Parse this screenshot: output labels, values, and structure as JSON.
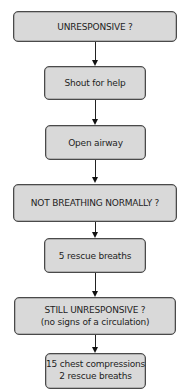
{
  "flowchart": {
    "title": "Basic life support algorithm",
    "nodes": [
      {
        "id": "unresponsive",
        "lines": [
          "UNRESPONSIVE ?"
        ]
      },
      {
        "id": "shout",
        "lines": [
          "Shout for help"
        ]
      },
      {
        "id": "airway",
        "lines": [
          "Open airway"
        ]
      },
      {
        "id": "not-breathing",
        "lines": [
          "NOT BREATHING NORMALLY ?"
        ]
      },
      {
        "id": "rescue-breaths",
        "lines": [
          "5 rescue breaths"
        ]
      },
      {
        "id": "still-unresponsive",
        "lines": [
          "STILL UNRESPONSIVE ?",
          "(no signs of a circulation)"
        ]
      },
      {
        "id": "cpr",
        "lines": [
          "15 chest compressions",
          "2 rescue breaths"
        ]
      }
    ],
    "edges": [
      {
        "from": "unresponsive",
        "to": "shout"
      },
      {
        "from": "shout",
        "to": "airway"
      },
      {
        "from": "airway",
        "to": "not-breathing"
      },
      {
        "from": "not-breathing",
        "to": "rescue-breaths"
      },
      {
        "from": "rescue-breaths",
        "to": "still-unresponsive"
      },
      {
        "from": "still-unresponsive",
        "to": "cpr"
      }
    ],
    "colors": {
      "box_fill": "#d9d9d9",
      "box_border": "#4a4a4a",
      "arrow": "#222222",
      "text": "#1e1e1e"
    }
  }
}
